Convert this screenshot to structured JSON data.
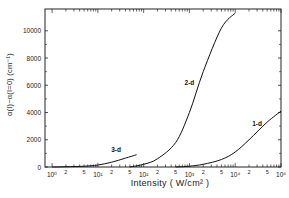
{
  "chart_data": {
    "type": "line",
    "title": "",
    "xlabel": "Intensity ( W/cm² )",
    "ylabel": "α(I)−α(I=0) (cm⁻¹)",
    "xscale": "log",
    "xlim": [
      0.7,
      100000
    ],
    "ylim": [
      0,
      11600
    ],
    "x_ticks_major": [
      "10⁰",
      "10¹",
      "10²",
      "10³",
      "10⁴",
      "10⁵"
    ],
    "x_ticks_minor_labels": [
      "2",
      "5",
      "2",
      "5",
      "2",
      "5",
      "2",
      "5",
      "2",
      "5"
    ],
    "y_ticks": [
      0,
      2000,
      4000,
      6000,
      8000,
      10000
    ],
    "grid": false,
    "legend": "inline labels",
    "series": [
      {
        "name": "3-d",
        "x": [
          1,
          2,
          5,
          10,
          20,
          40,
          70
        ],
        "y": [
          0,
          20,
          60,
          150,
          350,
          650,
          900
        ]
      },
      {
        "name": "2-d",
        "x": [
          50,
          100,
          200,
          500,
          1000,
          2000,
          5000,
          10000
        ],
        "y": [
          0,
          200,
          600,
          1800,
          4000,
          7000,
          10200,
          11300
        ]
      },
      {
        "name": "1-d",
        "x": [
          500,
          1000,
          2000,
          5000,
          10000,
          20000,
          50000,
          100000
        ],
        "y": [
          0,
          60,
          200,
          550,
          1100,
          2000,
          3300,
          4100
        ]
      }
    ],
    "annotations": [
      {
        "text": "3-d",
        "x": 25,
        "y": 1100
      },
      {
        "text": "2-d",
        "x": 1000,
        "y": 6000
      },
      {
        "text": "1-d",
        "x": 30000,
        "y": 3000
      }
    ]
  },
  "labels": {
    "xlabel": "Intensity ( W/cm² )",
    "ylabel": "α(I)−α(I=0) (cm⁻¹)"
  }
}
